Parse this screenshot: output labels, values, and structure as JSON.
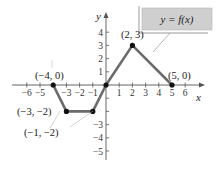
{
  "chart_data": {
    "type": "line",
    "title": "",
    "xlabel": "x",
    "ylabel": "y",
    "xlim": [
      -6.5,
      7
    ],
    "ylim": [
      -6,
      4.5
    ],
    "grid": false,
    "legend": null,
    "x_ticks": [
      -6,
      -5,
      -3,
      -2,
      -1,
      1,
      2,
      3,
      4,
      5,
      6
    ],
    "x_tick_labels": [
      "−6",
      "−5",
      "−3",
      "−2",
      "−1",
      "1",
      "2",
      "3",
      "4",
      "5",
      "6"
    ],
    "y_ticks": [
      4,
      3,
      2,
      1,
      -3,
      -4,
      -5
    ],
    "y_tick_labels": [
      "4",
      "3",
      "2",
      "1",
      "−3",
      "−4",
      "−5"
    ],
    "series": [
      {
        "name": "y = f(x)",
        "color": "#6b6b6b",
        "points": [
          [
            -4,
            0
          ],
          [
            -3,
            -2
          ],
          [
            -1,
            -2
          ],
          [
            0,
            0
          ],
          [
            2,
            3
          ],
          [
            5,
            0
          ]
        ]
      }
    ],
    "annotations": [
      {
        "text": "(−4, 0)",
        "x": -4,
        "y": 0
      },
      {
        "text": "(−3, −2)",
        "x": -3,
        "y": -2
      },
      {
        "text": "(−1, −2)",
        "x": -1,
        "y": -2
      },
      {
        "text": "(2, 3)",
        "x": 2,
        "y": 3
      },
      {
        "text": "(5, 0)",
        "x": 5,
        "y": 0
      }
    ],
    "function_label": "y = f(x)",
    "label_box_color": "#cfcfcf"
  }
}
